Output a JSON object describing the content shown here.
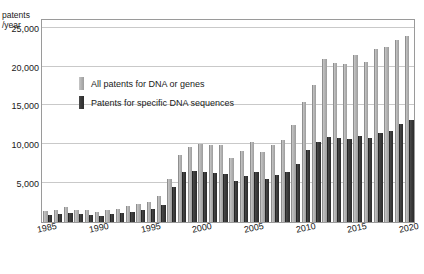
{
  "chart_data": {
    "type": "bar",
    "title": "",
    "subtitle": "",
    "xlabel": "",
    "ylabel": "patents\n/year",
    "ylim": [
      0,
      26000
    ],
    "xlim_categories": [
      "1985",
      "2020"
    ],
    "grid": true,
    "gridlines_y": [
      5000,
      10000,
      15000,
      20000,
      25000
    ],
    "ytick_labels": [
      "5,000",
      "10,000",
      "15,000",
      "20,000",
      "25,000"
    ],
    "ytick_values": [
      5000,
      10000,
      15000,
      20000,
      25000
    ],
    "xtick_labels": [
      "1985",
      "1990",
      "1995",
      "2000",
      "2005",
      "2010",
      "2015",
      "2020"
    ],
    "xtick_values": [
      1985,
      1990,
      1995,
      2000,
      2005,
      2010,
      2015,
      2020
    ],
    "legend_position": "inside-upper-left",
    "categories": [
      "1985",
      "1986",
      "1987",
      "1988",
      "1989",
      "1990",
      "1991",
      "1992",
      "1993",
      "1994",
      "1995",
      "1996",
      "1997",
      "1998",
      "1999",
      "2000",
      "2001",
      "2002",
      "2003",
      "2004",
      "2005",
      "2006",
      "2007",
      "2008",
      "2009",
      "2010",
      "2011",
      "2012",
      "2013",
      "2014",
      "2015",
      "2016",
      "2017",
      "2018",
      "2019",
      "2020"
    ],
    "series": [
      {
        "name": "All patents for DNA or genes",
        "color": "#b2b2b2",
        "values": [
          1400,
          1500,
          1900,
          1600,
          1500,
          1300,
          1500,
          1700,
          2100,
          2300,
          2600,
          3400,
          5500,
          8600,
          9600,
          10000,
          9900,
          9900,
          8200,
          9200,
          10300,
          9000,
          9900,
          10600,
          12500,
          15400,
          17600,
          21000,
          20500,
          20400,
          21500,
          20600,
          22300,
          22500,
          23400,
          23900
        ]
      },
      {
        "name": "Patents for specific DNA sequences",
        "color": "#3a3a3a",
        "values": [
          900,
          1000,
          1100,
          1000,
          900,
          800,
          1000,
          1100,
          1300,
          1500,
          1700,
          2200,
          4500,
          6400,
          6600,
          6400,
          6300,
          6200,
          5300,
          5900,
          6400,
          5600,
          6000,
          6500,
          7500,
          9300,
          10300,
          10900,
          10800,
          10700,
          11100,
          10800,
          11500,
          11700,
          12600,
          13100
        ]
      }
    ]
  },
  "legend": {
    "items": [
      {
        "label": "All patents for DNA or genes",
        "swatch": "all"
      },
      {
        "label": "Patents for specific DNA sequences",
        "swatch": "specific"
      }
    ]
  }
}
